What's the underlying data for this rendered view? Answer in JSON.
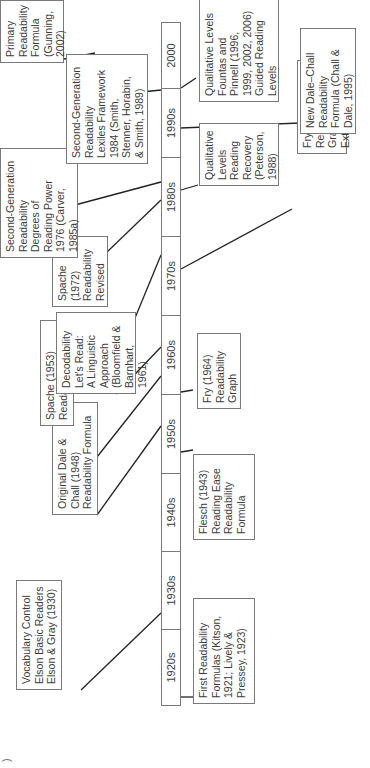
{
  "diagram": {
    "title": "",
    "orientation": "rotated-90-counterclockwise",
    "timeline": {
      "decades": [
        "1920s",
        "1930s",
        "1940s",
        "1950s",
        "1960s",
        "1970s",
        "1980s",
        "1990s",
        "2000"
      ]
    },
    "events_above": [
      {
        "id": "vocabulary-control",
        "decade": "1930s",
        "text": "Vocabulary Control\nElson Basic Readers\nElson & Gray (1930)"
      },
      {
        "id": "original-dale-chall",
        "decade": "1940s",
        "text": "Original Dale &\nChall (1948)\nReadability Formula"
      },
      {
        "id": "spache-1953",
        "decade": "1950s",
        "text": "Spache (1953)\nReadability Formula"
      },
      {
        "id": "decodability",
        "decade": "1960s",
        "text": "Decodability\nLet's Read:\nA Linguistic\nApproach\n(Bloomfield &\nBarnhart, 1961)"
      },
      {
        "id": "spache-1972",
        "decade": "1970s",
        "text": "Spache\n(1972)\nReadability\nRevised"
      },
      {
        "id": "degrees-reading-power",
        "decade": "1970s",
        "text": "Second-Generation\nReadability\nDegrees of\nReading Power\n1976 (Carver,\n1985a)"
      },
      {
        "id": "lexiles",
        "decade": "1980s",
        "text": "Second-Generation\nReadability\nLexiles Framework\n1984 (Smith,\nStenner, Horabin,\n& Smith, 1989)"
      },
      {
        "id": "primary-readability",
        "decade": "2000",
        "text": "Primary\nReadability\nFormula\n(Gunning,\n2002)"
      }
    ],
    "events_below": [
      {
        "id": "first-readability",
        "decade": "1920s",
        "text": "First Readability\nFormulas (Kitson,\n1921; Lively &\nPressey, 1923)"
      },
      {
        "id": "flesch",
        "decade": "1940s",
        "text": "Flesch (1943)\nReading Ease\nReadability\nFormula"
      },
      {
        "id": "fry-1964",
        "decade": "1960s",
        "text": "Fry (1964)\nReadability\nGraph"
      },
      {
        "id": "fry-1977",
        "decade": "1970s",
        "text": "Fry (1977)\nReadability Graph\nExtended"
      },
      {
        "id": "reading-recovery",
        "decade": "1980s",
        "text": "Qualitative\nLevels\nReading\nRecovery\n(Peterson,\n1988)"
      },
      {
        "id": "fountas-pinnell",
        "decade": "1990s",
        "text": "Qualitative Levels\nFountas and\nPinnell (1996,\n1999, 2002, 2006)\nGuided Reading\nLevels"
      },
      {
        "id": "new-dale-chall",
        "decade": "1990s",
        "text": "New Dale–Chall\nReadability\nFormula (Chall &\nDale, 1995)"
      }
    ],
    "corner_glyph": ")"
  },
  "colors": {
    "line": "#222222",
    "border": "#7a7a7a",
    "text": "#3c3c3c",
    "background": "#ffffff"
  }
}
